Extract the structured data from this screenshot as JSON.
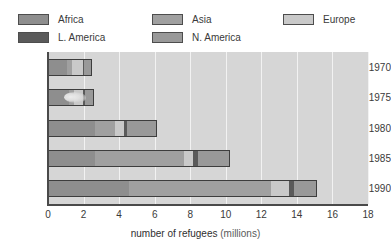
{
  "chart_data": {
    "type": "bar",
    "orientation": "horizontal",
    "stacked": true,
    "title": "",
    "xlabel": "number of refugees (millions)",
    "xlabel_main": "number of refugees",
    "xlabel_unit": "(millions)",
    "ylabel": "",
    "categories": [
      "1970",
      "1975",
      "1980",
      "1985",
      "1990"
    ],
    "xlim": [
      0,
      18
    ],
    "xticks": [
      "0",
      "2",
      "4",
      "6",
      "8",
      "10",
      "12",
      "14",
      "16",
      "18"
    ],
    "grid": "vertical-white-gridlines",
    "legend_position": "top",
    "series": [
      {
        "name": "Africa",
        "color": "#8e8e8e",
        "values": [
          1.0,
          1.1,
          2.6,
          2.6,
          4.5
        ]
      },
      {
        "name": "Asia",
        "color": "#a0a0a0",
        "values": [
          0.3,
          0.3,
          1.1,
          5.0,
          8.0
        ]
      },
      {
        "name": "Europe",
        "color": "#c9c9c9",
        "values": [
          0.6,
          0.5,
          0.5,
          0.5,
          1.0
        ]
      },
      {
        "name": "L. America",
        "color": "#5a5a5a",
        "values": [
          0.05,
          0.1,
          0.2,
          0.3,
          0.3
        ]
      },
      {
        "name": "N. America",
        "color": "#999999",
        "values": [
          0.4,
          0.5,
          1.6,
          1.7,
          1.2
        ]
      }
    ],
    "totals": [
      2.35,
      2.5,
      6.0,
      10.1,
      15.0
    ],
    "annotations": [
      {
        "name": "scan-smudge",
        "category": "1975",
        "description": "light scanning artifact over bar"
      }
    ]
  },
  "legend": {
    "items": [
      {
        "label": "Africa",
        "color": "#8e8e8e"
      },
      {
        "label": "Asia",
        "color": "#a0a0a0"
      },
      {
        "label": "Europe",
        "color": "#c9c9c9"
      },
      {
        "label": "L. America",
        "color": "#5a5a5a"
      },
      {
        "label": "N. America",
        "color": "#999999"
      }
    ]
  },
  "colors": {
    "plot_background": "#d6d6d6",
    "gridline": "#f2f2f2",
    "axis": "#4a4a4a",
    "bar_outline": "#3d3d3d",
    "text": "#3a3a3a"
  }
}
